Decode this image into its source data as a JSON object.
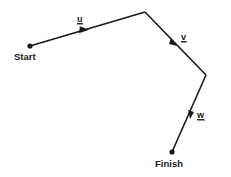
{
  "diagram": {
    "type": "vector-path",
    "colors": {
      "line": "#1a1a1a",
      "background": "#ffffff"
    },
    "points": {
      "start": {
        "label": "Start",
        "x": 30,
        "y": 46
      },
      "p1": {
        "x": 145,
        "y": 12
      },
      "p2": {
        "x": 206,
        "y": 75
      },
      "finish": {
        "label": "Finish",
        "x": 172,
        "y": 152
      }
    },
    "vectors": [
      {
        "name": "u",
        "label": "u",
        "from": "start",
        "to": "p1"
      },
      {
        "name": "v",
        "label": "v",
        "from": "p1",
        "to": "p2"
      },
      {
        "name": "w",
        "label": "w",
        "from": "p2",
        "to": "finish"
      }
    ]
  }
}
